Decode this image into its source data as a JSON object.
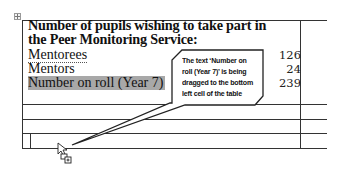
{
  "table": {
    "title": "Number of pupils  wishing to take part in the Peer Monitoring Service:",
    "title_line1": "Number of pupils  wishing to take part in",
    "title_line2": "the Peer Monitoring Service:",
    "rows": [
      {
        "label": "Mentorees",
        "value": "126"
      },
      {
        "label": "Mentors",
        "value": "24"
      },
      {
        "label": "Number on roll (Year 7)",
        "value": "239"
      }
    ],
    "selected_row_label": "Number on roll (Year 7)",
    "empty_rows": 3
  },
  "callout": {
    "text": "The text 'Number on roll (Year 7)' is being dragged to the bottom left cell of the table",
    "line1": "The text ‘Number on",
    "line2": "roll (Year 7)’ is being",
    "line3": "dragged to the bottom",
    "line4": "left cell of the table"
  },
  "cursor": {
    "type": "drag-copy-cursor-icon"
  },
  "colors": {
    "selection": "#a8a8a8",
    "lines": "#333333",
    "text": "#111111"
  }
}
